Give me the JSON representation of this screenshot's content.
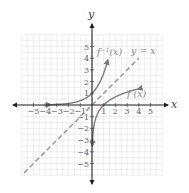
{
  "chart_data": {
    "type": "line",
    "title": "",
    "xlabel": "x",
    "ylabel": "y",
    "xlim": [
      -6,
      6
    ],
    "ylim": [
      -6,
      6
    ],
    "grid": true,
    "grid_step": 0.5,
    "x_ticks": [
      -5,
      -4,
      -3,
      -2,
      -1,
      1,
      2,
      3,
      4,
      5
    ],
    "y_ticks": [
      -5,
      -4,
      -3,
      -2,
      -1,
      1,
      2,
      3,
      4,
      5
    ],
    "x_tick_labels": [
      "−5",
      "−4",
      "−3",
      "−2",
      "−1",
      "1",
      "2",
      "3",
      "4",
      "5"
    ],
    "y_tick_labels": [
      "−5",
      "−4",
      "−3",
      "−2",
      "−1",
      "1",
      "2",
      "3",
      "4",
      "5"
    ],
    "series": [
      {
        "name": "f^-1(x)",
        "label": "f⁻¹(x)",
        "style": "solid",
        "color": "#7a7a7a",
        "x": [
          -3.5,
          -3,
          -2.5,
          -2,
          -1.5,
          -1,
          -0.5,
          0,
          0.5,
          1,
          1.5,
          1.9
        ],
        "y": [
          0.03,
          0.05,
          0.08,
          0.14,
          0.22,
          0.37,
          0.61,
          1.0,
          1.65,
          2.72,
          4.48,
          3.7
        ]
      },
      {
        "name": "f(x)",
        "label": "f(x)",
        "style": "solid",
        "color": "#7a7a7a",
        "x": [
          0.03,
          0.05,
          0.14,
          0.37,
          1,
          1.65,
          2.72,
          3.9
        ],
        "y": [
          -3.5,
          -3,
          -2,
          -1,
          0,
          0.5,
          1,
          1.9
        ]
      },
      {
        "name": "y = x",
        "label": "y = x",
        "style": "dashed",
        "color": "#9a9a9a",
        "x": [
          -5.8,
          4
        ],
        "y": [
          -5.8,
          4
        ]
      }
    ],
    "annotations": [
      "f⁻¹(x)",
      "y = x",
      "f(x)"
    ]
  },
  "labels": {
    "x_axis": "x",
    "y_axis": "y",
    "finv": "f",
    "finv_sup": "−1",
    "finv_arg": "(x)",
    "identity": "y = x",
    "f": "f (x)"
  }
}
